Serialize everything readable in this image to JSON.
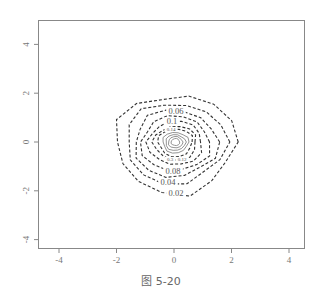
{
  "chart_data": {
    "type": "contour",
    "title": "",
    "xlabel": "",
    "ylabel": "",
    "xlim": [
      -4.6,
      4.6
    ],
    "ylim": [
      -4.3,
      5.0
    ],
    "xticks": [
      -4,
      -2,
      0,
      2,
      4
    ],
    "yticks": [
      -4,
      -2,
      0,
      2,
      4
    ],
    "grid": false,
    "legend": null,
    "center": [
      0,
      0
    ],
    "levels": [
      {
        "level": 0.02,
        "label": "0.02",
        "rx": 2.1,
        "ry_top": 1.95,
        "ry_bottom": 2.1,
        "style": "dashed"
      },
      {
        "level": 0.04,
        "label": "0.04",
        "rx": 1.75,
        "ry_top": 1.6,
        "ry_bottom": 1.7,
        "style": "dashed"
      },
      {
        "level": 0.06,
        "label": "0.06",
        "rx": 1.45,
        "ry_top": 1.3,
        "ry_bottom": 1.45,
        "style": "dashed"
      },
      {
        "level": 0.08,
        "label": "0.08",
        "rx": 1.2,
        "ry_top": 1.05,
        "ry_bottom": 1.2,
        "style": "dashed"
      },
      {
        "level": 0.1,
        "label": "0.1",
        "rx": 0.95,
        "ry_top": 0.85,
        "ry_bottom": 0.95,
        "style": "dashed"
      },
      {
        "level": 0.12,
        "label": "0.12",
        "rx": 0.75,
        "ry_top": 0.65,
        "ry_bottom": 0.75,
        "style": "dashed"
      },
      {
        "level": 0.14,
        "label": "0.14",
        "rx": 0.6,
        "ry_top": 0.55,
        "ry_bottom": 0.6,
        "style": "dashed"
      },
      {
        "level": 0.2,
        "label": "",
        "rx": 0.45,
        "ry_top": 0.4,
        "ry_bottom": 0.45,
        "style": "solid"
      },
      {
        "level": 0.25,
        "label": "",
        "rx": 0.35,
        "ry_top": 0.3,
        "ry_bottom": 0.35,
        "style": "solid"
      },
      {
        "level": 0.3,
        "label": "0.3",
        "rx": 0.25,
        "ry_top": 0.22,
        "ry_bottom": 0.25,
        "style": "solid"
      },
      {
        "level": 0.35,
        "label": "",
        "rx": 0.15,
        "ry_top": 0.14,
        "ry_bottom": 0.15,
        "style": "solid"
      }
    ],
    "annotations": [
      "0.06",
      "0.1",
      "0.14",
      "0.3",
      "0.12",
      "0.08",
      "0.04",
      "0.02"
    ]
  },
  "caption": "图 5-20"
}
